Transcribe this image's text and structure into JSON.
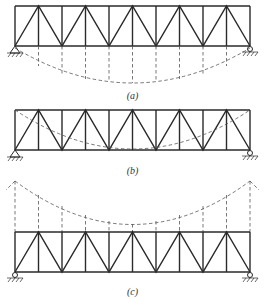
{
  "figure": {
    "panels": [
      {
        "id": "a",
        "label": "(a)",
        "description": "Truss with suspension cable below (underslung arch/cable)"
      },
      {
        "id": "b",
        "label": "(b)",
        "description": "Truss with cable within the truss depth"
      },
      {
        "id": "c",
        "label": "(c)",
        "description": "Truss suspended from cable above towers"
      }
    ],
    "truss": {
      "panel_count": 10,
      "x_left": 15,
      "x_right": 250
    },
    "colors": {
      "line": "#2a2a2a",
      "dashed": "#555555",
      "background": "#ffffff"
    }
  }
}
